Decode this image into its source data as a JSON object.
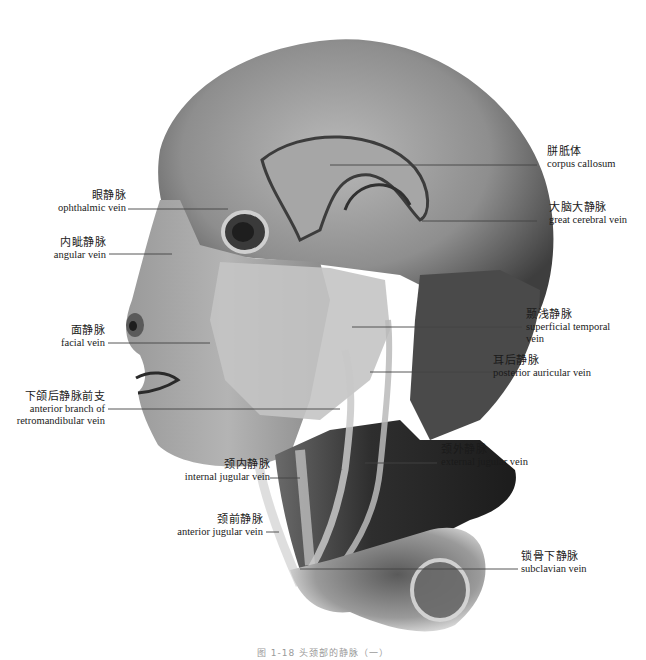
{
  "figure": {
    "caption": "图 1-18  头颈部的静脉（一）"
  },
  "labels": {
    "corpus_callosum": {
      "zh": "胼胝体",
      "en": "corpus callosum"
    },
    "great_cerebral_vein": {
      "zh": "大脑大静脉",
      "en": "great cerebral vein"
    },
    "ophthalmic_vein": {
      "zh": "眼静脉",
      "en": "ophthalmic vein"
    },
    "angular_vein": {
      "zh": "内眦静脉",
      "en": "angular vein"
    },
    "facial_vein": {
      "zh": "面静脉",
      "en": "facial vein"
    },
    "retromandibular_anterior": {
      "zh": "下颌后静脉前支",
      "en_line1": "anterior branch of",
      "en_line2": "retromandibular vein"
    },
    "superficial_temporal_vein": {
      "zh": "颞浅静脉",
      "en_line1": "superficial temporal",
      "en_line2": "vein"
    },
    "posterior_auricular_vein": {
      "zh": "耳后静脉",
      "en": "posterior auricular vein"
    },
    "internal_jugular_vein": {
      "zh": "颈内静脉",
      "en": "internal jugular vein"
    },
    "external_jugular_vein": {
      "zh": "颈外静脉",
      "en": "external jugular vein"
    },
    "anterior_jugular_vein": {
      "zh": "颈前静脉",
      "en": "anterior jugular vein"
    },
    "subclavian_vein": {
      "zh": "锁骨下静脉",
      "en": "subclavian vein"
    }
  },
  "colors": {
    "background": "#ffffff",
    "specimen_dark": "#3a3a3a",
    "specimen_mid": "#7a7a7a",
    "specimen_light": "#c8c8c8",
    "leader_line": "#444444",
    "text": "#1a1a1a"
  }
}
